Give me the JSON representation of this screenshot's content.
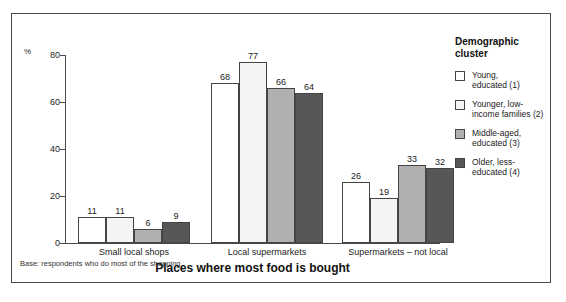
{
  "chart_data": {
    "type": "bar",
    "title": "",
    "xlabel": "Places where most food is bought",
    "ylabel": "%",
    "categories": [
      "Small local shops",
      "Local supermarkets",
      "Supermarkets – not local"
    ],
    "series": [
      {
        "name": "Young, educated (1)",
        "values": [
          11,
          68,
          26
        ],
        "color": "#ffffff"
      },
      {
        "name": "Younger, low-income families (2)",
        "values": [
          11,
          77,
          19
        ],
        "color": "#f4f4f4"
      },
      {
        "name": "Middle-aged, educated (3)",
        "values": [
          6,
          66,
          33
        ],
        "color": "#b0b0b0"
      },
      {
        "name": "Older, less-educated (4)",
        "values": [
          9,
          64,
          32
        ],
        "color": "#575757"
      }
    ],
    "ylim": [
      0,
      80
    ],
    "yticks": [
      0,
      20,
      40,
      60,
      80
    ],
    "ytick_labels": [
      "0",
      "20",
      "40",
      "60",
      "80"
    ],
    "grid": false,
    "legend_position": "right",
    "annotations": [
      "Base: respondents who do most of the shopping"
    ]
  },
  "axis": {
    "unit_label": "%"
  },
  "legend": {
    "title_line1": "Demographic",
    "title_line2": "cluster",
    "items": [
      {
        "line1": "Young,",
        "line2": "educated (1)"
      },
      {
        "line1": "Younger, low-",
        "line2": "income families (2)"
      },
      {
        "line1": "Middle-aged,",
        "line2": "educated (3)"
      },
      {
        "line1": "Older, less-",
        "line2": "educated (4)"
      }
    ]
  },
  "footnote": {
    "text": "Base: respondents who do most of the shopping"
  }
}
